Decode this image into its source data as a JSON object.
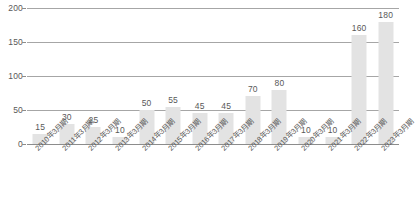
{
  "chart_data": {
    "type": "bar",
    "title": "",
    "subtitle": "",
    "xlabel": "",
    "ylabel": "",
    "ylim": [
      0,
      200
    ],
    "yticks": [
      0,
      50,
      100,
      150,
      200
    ],
    "grid": true,
    "legend": false,
    "legend_position": "none",
    "bar_color": "#e3e3e3",
    "grid_color": "#a6a6a6",
    "text_color": "#595959",
    "categories": [
      "2010年3月期",
      "2011年3月期",
      "2012年3月期",
      "2013年3月期",
      "2014年3月期",
      "2015年3月期",
      "2016年3月期",
      "2017年3月期",
      "2018年3月期",
      "2019年3月期",
      "2020年3月期",
      "2021年3月期",
      "2022年3月期",
      "2023年3月期"
    ],
    "values": [
      15,
      30,
      25,
      10,
      50,
      55,
      45,
      45,
      70,
      80,
      10,
      10,
      160,
      180
    ],
    "data_labels": [
      "15",
      "30",
      "25",
      "10",
      "50",
      "55",
      "45",
      "45",
      "70",
      "80",
      "10",
      "10",
      "160",
      "180"
    ]
  },
  "source_note": ""
}
